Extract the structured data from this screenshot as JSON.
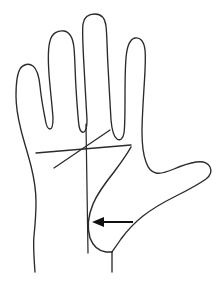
{
  "figure": {
    "background_color": "#ffffff",
    "stroke_color": "#2b2b2b",
    "arrow_color": "#111111",
    "canvas": {
      "width": 219,
      "height": 282
    }
  },
  "digits": [
    {
      "name": "pinky-finger",
      "tip_x": 27,
      "tip_y": 65
    },
    {
      "name": "ring-finger",
      "tip_x": 62,
      "tip_y": 30
    },
    {
      "name": "middle-finger",
      "tip_x": 95,
      "tip_y": 14
    },
    {
      "name": "index-finger",
      "tip_x": 134,
      "tip_y": 37
    },
    {
      "name": "thumb",
      "tip_x": 210,
      "tip_y": 168
    }
  ],
  "annotations": {
    "arrow": {
      "label": "thenar-eminence-pointer",
      "direction": "left",
      "from_x": 133,
      "from_y": 222,
      "to_x": 92,
      "to_y": 222
    },
    "crease_upper": {
      "label": "upper-palmar-crease",
      "x1": 36,
      "y1": 153,
      "x2": 131,
      "y2": 145
    },
    "crease_lower": {
      "label": "lower-palmar-crease",
      "x1": 54,
      "y1": 168,
      "x2": 110,
      "y2": 130
    },
    "vertical_reference": {
      "label": "vertical-reference-line",
      "x1": 86,
      "y1": 124,
      "x2": 88,
      "y2": 253
    },
    "thenar_boundary": {
      "label": "thenar-eminence-boundary"
    }
  }
}
